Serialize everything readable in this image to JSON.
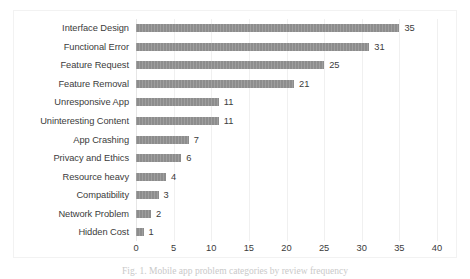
{
  "chart_data": {
    "type": "bar",
    "orientation": "horizontal",
    "title": "",
    "xlabel": "",
    "ylabel": "",
    "xlim": [
      0,
      40
    ],
    "xticks": [
      0,
      5,
      10,
      15,
      20,
      25,
      30,
      35,
      40
    ],
    "grid": true,
    "legend": false,
    "bar_color": "#8d8d8d",
    "text_color": "#3b3b3b",
    "gridline_color": "#f0f0f0",
    "categories": [
      "Interface Design",
      "Functional Error",
      "Feature Request",
      "Feature Removal",
      "Unresponsive App",
      "Uninteresting Content",
      "App Crashing",
      "Privacy and Ethics",
      "Resource heavy",
      "Compatibility",
      "Network Problem",
      "Hidden Cost"
    ],
    "values": [
      35,
      31,
      25,
      21,
      11,
      11,
      7,
      6,
      4,
      3,
      2,
      1
    ],
    "data_labels": [
      "35",
      "31",
      "25",
      "21",
      "11",
      "11",
      "7",
      "6",
      "4",
      "3",
      "2",
      "1"
    ]
  },
  "caption": {
    "text": "Fig. 1. Mobile app problem categories by review frequency"
  }
}
